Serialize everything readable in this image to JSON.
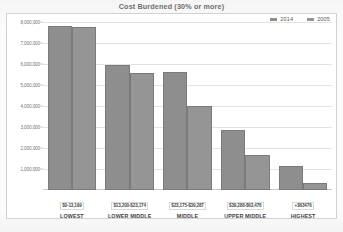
{
  "chart_data": {
    "type": "bar",
    "title": "Cost Burdened (30% or more)",
    "xlabel": "",
    "ylabel": "",
    "ylim": [
      0,
      8000000
    ],
    "grid": true,
    "legend_position": "top-right",
    "categories": [
      "$0-13,199",
      "$13,200-$23,174",
      "$23,175-$39,287",
      "$39,288-$63,476",
      "+$63476"
    ],
    "category_names": [
      "LOWEST",
      "LOWER MIDDLE",
      "MIDDLE",
      "UPPER MIDDLE",
      "HIGHEST"
    ],
    "series": [
      {
        "name": "2014",
        "color": "#8e8e8e",
        "values": [
          7800000,
          5950000,
          5600000,
          2850000,
          1150000
        ]
      },
      {
        "name": "2005",
        "color": "#959595",
        "values": [
          7750000,
          5550000,
          4000000,
          1650000,
          350000
        ]
      }
    ],
    "y_ticks": [
      "8,000,000",
      "7,000,000",
      "6,000,000",
      "5,000,000",
      "4,000,000",
      "3,000,000",
      "2,000,000",
      "1,000,000"
    ],
    "y_tick_values": [
      8000000,
      7000000,
      6000000,
      5000000,
      4000000,
      3000000,
      2000000,
      1000000
    ]
  }
}
